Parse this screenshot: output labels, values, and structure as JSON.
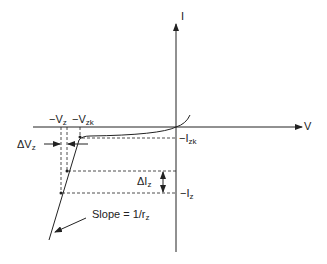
{
  "diagram": {
    "axes": {
      "x_label": "V",
      "y_label": "I"
    },
    "labels": {
      "neg_vz": {
        "main": "−V",
        "sub": "z"
      },
      "neg_vzk": {
        "main": "−V",
        "sub": "zk"
      },
      "delta_vz": {
        "main": "ΔV",
        "sub": "z"
      },
      "neg_izk": {
        "main": "−I",
        "sub": "zk"
      },
      "delta_iz": {
        "main": "ΔI",
        "sub": "z"
      },
      "neg_iz": {
        "main": "−I",
        "sub": "z"
      },
      "slope": {
        "main": "Slope = 1/r",
        "sub": "z"
      }
    },
    "colors": {
      "line": "#222222",
      "background": "#ffffff"
    }
  }
}
